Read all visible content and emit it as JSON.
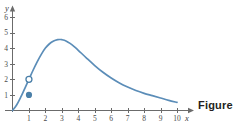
{
  "figure": {
    "caption": "Figure",
    "background_color": "#ffffff"
  },
  "chart_data": {
    "type": "line",
    "title": "",
    "subtitle": "",
    "xlabel": "x",
    "ylabel": "y",
    "xlim": [
      0,
      10.6
    ],
    "ylim": [
      0,
      6.6
    ],
    "grid": false,
    "legend": null,
    "axis_color": "#6b6b6b",
    "curve_color": "#5b8db8",
    "marker_color": "#4a7fa8",
    "x_ticks": [
      1,
      2,
      3,
      4,
      5,
      6,
      7,
      8,
      9,
      10
    ],
    "y_ticks": [
      1,
      2,
      3,
      4,
      5,
      6
    ],
    "x_tick_labels": [
      "1",
      "2",
      "3",
      "4",
      "5",
      "6",
      "7",
      "8",
      "9",
      "10"
    ],
    "y_tick_labels": [
      "1",
      "2",
      "3",
      "4",
      "5",
      "6"
    ],
    "series": [
      {
        "name": "curve",
        "x": [
          0,
          0.25,
          0.5,
          0.75,
          1,
          1.25,
          1.5,
          1.75,
          2,
          2.25,
          2.5,
          2.75,
          2.9,
          3,
          3.25,
          3.5,
          3.75,
          4,
          4.5,
          5,
          5.5,
          6,
          6.5,
          7,
          7.5,
          8,
          8.5,
          9,
          9.5,
          10
        ],
        "y": [
          0,
          0.35,
          0.85,
          1.42,
          2.0,
          2.58,
          3.12,
          3.6,
          4.0,
          4.28,
          4.45,
          4.54,
          4.55,
          4.54,
          4.46,
          4.3,
          4.1,
          3.86,
          3.36,
          2.88,
          2.45,
          2.08,
          1.76,
          1.5,
          1.28,
          1.1,
          0.95,
          0.8,
          0.65,
          0.52
        ]
      }
    ],
    "annotations": [
      {
        "kind": "open-circle",
        "label": "open point on curve",
        "x": 1,
        "y": 2
      },
      {
        "kind": "filled-circle",
        "label": "filled point below curve",
        "x": 1,
        "y": 1
      }
    ]
  }
}
